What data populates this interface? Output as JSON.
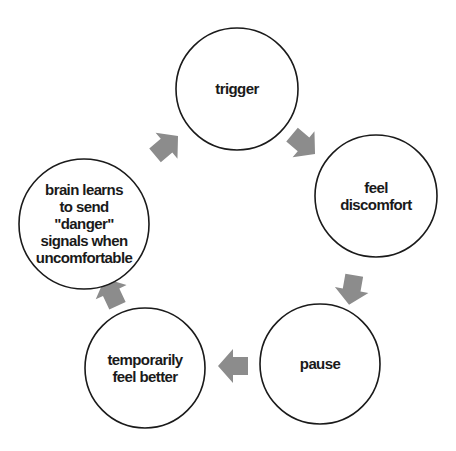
{
  "diagram": {
    "type": "cycle",
    "direction": "clockwise",
    "colors": {
      "background": "#ffffff",
      "circle_stroke": "#1a1a1a",
      "circle_fill": "#ffffff",
      "arrow_fill": "#8c8c8c",
      "text": "#1a1a1a"
    },
    "nodes": [
      {
        "id": "trigger",
        "lines": [
          "trigger"
        ],
        "cx": 237,
        "cy": 89,
        "r": 61
      },
      {
        "id": "feel-discomfort",
        "lines": [
          "feel",
          "discomfort"
        ],
        "cx": 376,
        "cy": 196,
        "r": 61
      },
      {
        "id": "pause",
        "lines": [
          "pause"
        ],
        "cx": 320,
        "cy": 364,
        "r": 60
      },
      {
        "id": "temporarily-feel-better",
        "lines": [
          "temporarily",
          "feel better"
        ],
        "cx": 145,
        "cy": 368,
        "r": 60
      },
      {
        "id": "brain-learns",
        "lines": [
          "brain learns",
          "to send",
          "\"danger\"",
          "signals when",
          "uncomfortable"
        ],
        "cx": 84,
        "cy": 224,
        "r": 65
      }
    ],
    "arrows": [
      {
        "from": "trigger",
        "to": "feel-discomfort",
        "x": 302,
        "y": 143,
        "angle": 40
      },
      {
        "from": "feel-discomfort",
        "to": "pause",
        "x": 352,
        "y": 288,
        "angle": 100
      },
      {
        "from": "pause",
        "to": "temporarily-feel-better",
        "x": 235,
        "y": 366,
        "angle": 180
      },
      {
        "from": "temporarily-feel-better",
        "to": "brain-learns",
        "x": 112,
        "y": 294,
        "angle": -115
      },
      {
        "from": "brain-learns",
        "to": "trigger",
        "x": 165,
        "y": 147,
        "angle": -40
      }
    ]
  }
}
